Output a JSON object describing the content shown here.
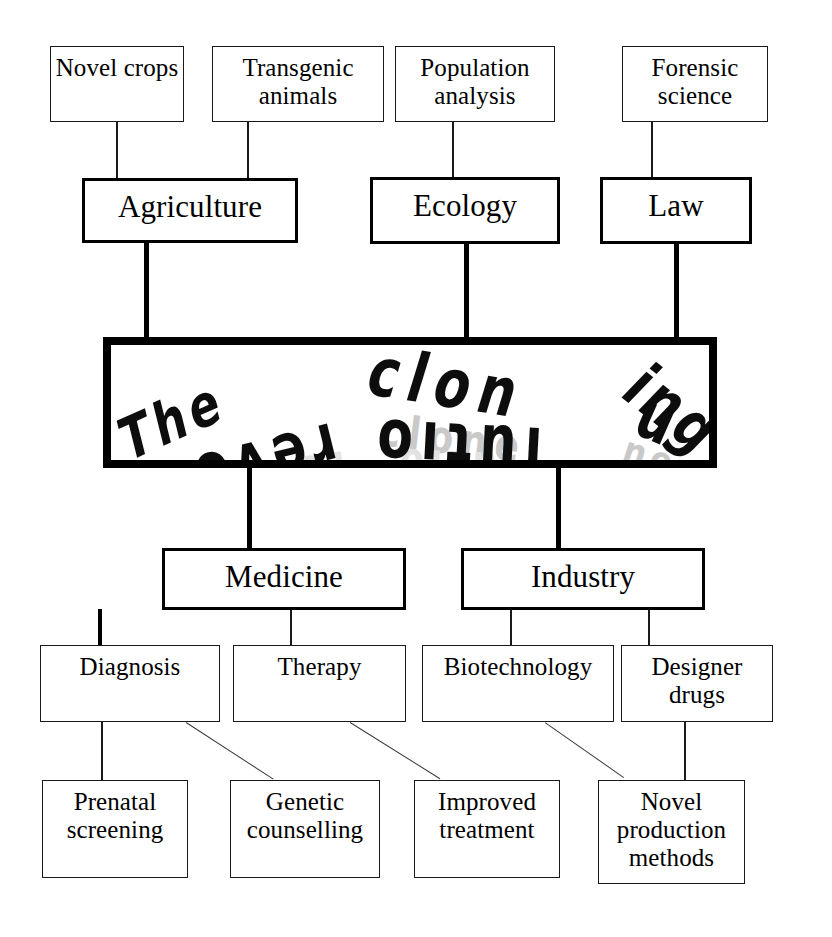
{
  "diagram": {
    "center": {
      "text": "The cloning revolution",
      "line_upper": "The cloning",
      "line_lower": "revolution",
      "fragments": {
        "the": "The",
        "clon": "clon",
        "ing": "ing",
        "revo": "revo",
        "lutio": "lutio",
        "n": "n",
        "echo_clone": "clone",
        "echo_revo": "revo",
        "echo_lutio": "lutio",
        "echo_tail": "ne",
        "echo_low": "clo"
      }
    },
    "branches": [
      {
        "id": "agriculture",
        "label": "Agriculture"
      },
      {
        "id": "ecology",
        "label": "Ecology"
      },
      {
        "id": "law",
        "label": "Law"
      },
      {
        "id": "medicine",
        "label": "Medicine"
      },
      {
        "id": "industry",
        "label": "Industry"
      }
    ],
    "leaves_top": [
      {
        "id": "novel-crops",
        "label": "Novel crops"
      },
      {
        "id": "transgenic-animals",
        "label": "Transgenic animals"
      },
      {
        "id": "population-analysis",
        "label": "Population analysis"
      },
      {
        "id": "forensic-science",
        "label": "Forensic science"
      }
    ],
    "leaves_mid": [
      {
        "id": "diagnosis",
        "label": "Diagnosis"
      },
      {
        "id": "therapy",
        "label": "Therapy"
      },
      {
        "id": "biotechnology",
        "label": "Biotechnology"
      },
      {
        "id": "designer-drugs",
        "label": "Designer drugs"
      }
    ],
    "leaves_bottom": [
      {
        "id": "prenatal-screening",
        "label": "Prenatal screening"
      },
      {
        "id": "genetic-counselling",
        "label": "Genetic counselling"
      },
      {
        "id": "improved-treatment",
        "label": "Improved treatment"
      },
      {
        "id": "novel-production-methods",
        "label": "Novel production methods"
      }
    ],
    "colors": {
      "line": "#1a1a1a",
      "thin_line": "#3a3a3a",
      "box_fill": "#ffffff",
      "text": "#000000",
      "echo_gray": "#c9c9c9",
      "echo_gray_faint": "#e2e2e2"
    }
  }
}
